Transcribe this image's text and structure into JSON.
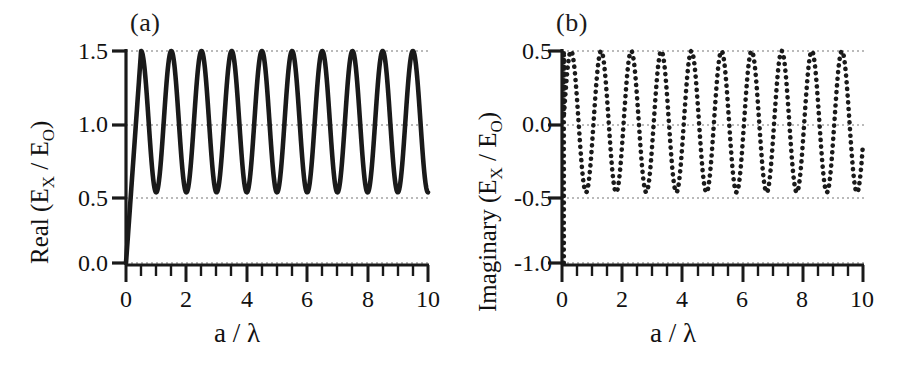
{
  "figure": {
    "background": "#ffffff",
    "ink_color": "#1a1a1a",
    "grid_color": "#8c8c8c"
  },
  "panels": [
    {
      "tag": "(a)",
      "ylabel_main": "Real (E",
      "ylabel_sub1": "X",
      "ylabel_mid": " / E",
      "ylabel_sub2": "O",
      "ylabel_end": ")",
      "xlabel": "a / λ",
      "ytick_labels": [
        "1.5",
        "1.0",
        "0.5",
        "0.0"
      ],
      "xtick_labels": [
        "0",
        "2",
        "4",
        "6",
        "8",
        "10"
      ]
    },
    {
      "tag": "(b)",
      "ylabel_main": "Imaginary (E",
      "ylabel_sub1": "X",
      "ylabel_mid": " / E",
      "ylabel_sub2": "O",
      "ylabel_end": ")",
      "xlabel": "a / λ",
      "ytick_labels": [
        "0.5",
        "0.0",
        "-0.5",
        "-1.0"
      ],
      "xtick_labels": [
        "0",
        "2",
        "4",
        "6",
        "8",
        "10"
      ]
    }
  ],
  "chart_data": [
    {
      "type": "line",
      "title": "(a)",
      "xlabel": "a / λ",
      "ylabel": "Real (E_X / E_O)",
      "xlim": [
        0,
        10
      ],
      "ylim": [
        0.0,
        1.5
      ],
      "xticks": [
        0,
        2,
        4,
        6,
        8,
        10
      ],
      "xticks_minor": [
        1,
        3,
        5,
        7,
        9
      ],
      "yticks": [
        0.0,
        0.5,
        1.0,
        1.5
      ],
      "grid": "dotted-horizontal",
      "legend": "none",
      "linestyle": "solid",
      "linewidth": 4,
      "color": "#1a1a1a",
      "description": "Starts at (0, 0.0), rises steeply to 1.5 at a/lambda = 0.5, then oscillates sinusoidally between 0.5 and 1.5 with period 1.0, ending near 0.5 at a/lambda = 10.",
      "formula": "y = 1.0 - 0.5*cos(2*pi*x) for x >= 0.5; linear rise 0 -> 1.5 over 0 <= x < 0.5",
      "x": [
        0.0,
        0.1,
        0.2,
        0.3,
        0.4,
        0.5,
        0.75,
        1.0,
        1.25,
        1.5,
        1.75,
        2.0,
        2.25,
        2.5,
        2.75,
        3.0,
        3.25,
        3.5,
        3.75,
        4.0,
        4.25,
        4.5,
        4.75,
        5.0,
        5.25,
        5.5,
        5.75,
        6.0,
        6.25,
        6.5,
        6.75,
        7.0,
        7.25,
        7.5,
        7.75,
        8.0,
        8.25,
        8.5,
        8.75,
        9.0,
        9.25,
        9.5,
        9.75,
        10.0
      ],
      "values": [
        0.0,
        0.3,
        0.6,
        0.9,
        1.2,
        1.5,
        1.0,
        0.5,
        1.0,
        1.5,
        1.0,
        0.5,
        1.0,
        1.5,
        1.0,
        0.5,
        1.0,
        1.5,
        1.0,
        0.5,
        1.0,
        1.5,
        1.0,
        0.5,
        1.0,
        1.5,
        1.0,
        0.5,
        1.0,
        1.5,
        1.0,
        0.5,
        1.0,
        1.5,
        1.0,
        0.5,
        1.0,
        1.5,
        1.0,
        0.5,
        1.0,
        1.5,
        1.0,
        0.5
      ],
      "peaks": [
        0.5,
        1.5,
        2.5,
        3.5,
        4.5,
        5.5,
        6.5,
        7.5,
        8.5,
        9.5
      ],
      "peak_value": 1.5,
      "troughs": [
        1.0,
        2.0,
        3.0,
        4.0,
        5.0,
        6.0,
        7.0,
        8.0,
        9.0
      ],
      "trough_value": 0.5,
      "n_oscillations": 10
    },
    {
      "type": "line",
      "title": "(b)",
      "xlabel": "a / λ",
      "ylabel": "Imaginary (E_X / E_O)",
      "xlim": [
        0,
        10
      ],
      "ylim": [
        -1.0,
        0.5
      ],
      "xticks": [
        0,
        2,
        4,
        6,
        8,
        10
      ],
      "xticks_minor": [
        1,
        3,
        5,
        7,
        9
      ],
      "yticks": [
        -1.0,
        -0.5,
        0.0,
        0.5
      ],
      "grid": "dotted-horizontal",
      "legend": "none",
      "linestyle": "dotted",
      "linewidth": 4,
      "color": "#1a1a1a",
      "description": "Vertical segment at a/lambda ~ 0.08 running from -1.0 up to +0.5, then oscillates sinusoidally between -0.5 and +0.5 with period 1.0, ending near -0.1 at a/lambda = 10.",
      "formula": "y = 0.5*cos(2*pi*(x-0.25)) shifted; vertical jump from -1.0 at x~0.08",
      "x": [
        0.08,
        0.08,
        0.3,
        0.55,
        0.8,
        1.05,
        1.3,
        1.55,
        1.8,
        2.05,
        2.3,
        2.55,
        2.8,
        3.05,
        3.3,
        3.55,
        3.8,
        4.05,
        4.3,
        4.55,
        4.8,
        5.05,
        5.3,
        5.55,
        5.8,
        6.05,
        6.3,
        6.55,
        6.8,
        7.05,
        7.3,
        7.55,
        7.8,
        8.05,
        8.3,
        8.55,
        8.8,
        9.05,
        9.3,
        9.55,
        9.8,
        10.0
      ],
      "values": [
        -1.0,
        0.5,
        0.5,
        0.0,
        -0.5,
        0.0,
        0.5,
        0.0,
        -0.5,
        0.0,
        0.5,
        0.0,
        -0.5,
        0.0,
        0.5,
        0.0,
        -0.5,
        0.0,
        0.5,
        0.0,
        -0.5,
        0.0,
        0.5,
        0.0,
        -0.5,
        0.0,
        0.5,
        0.0,
        -0.5,
        0.0,
        0.5,
        0.0,
        -0.5,
        0.0,
        0.5,
        0.0,
        -0.5,
        0.0,
        0.5,
        0.0,
        -0.5,
        -0.1
      ],
      "peaks": [
        0.3,
        1.3,
        2.3,
        3.3,
        4.3,
        5.3,
        6.3,
        7.3,
        8.3,
        9.3
      ],
      "peak_value": 0.5,
      "troughs": [
        0.8,
        1.8,
        2.8,
        3.8,
        4.8,
        5.8,
        6.8,
        7.8,
        8.8,
        9.8
      ],
      "trough_value": -0.5,
      "n_oscillations": 10
    }
  ]
}
